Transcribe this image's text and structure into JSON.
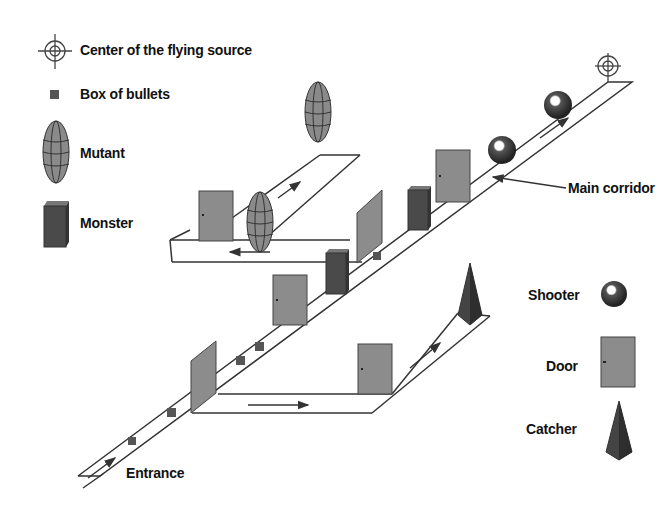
{
  "legend": {
    "items": [
      {
        "label": "Center of the flying source",
        "icon": "crosshair-icon"
      },
      {
        "label": "Box of bullets",
        "icon": "box-icon"
      },
      {
        "label": "Mutant",
        "icon": "ellipsoid-icon"
      },
      {
        "label": "Monster",
        "icon": "cuboid-icon"
      }
    ],
    "right_items": [
      {
        "label": "Shooter",
        "icon": "sphere-icon"
      },
      {
        "label": "Door",
        "icon": "door-icon"
      },
      {
        "label": "Catcher",
        "icon": "pyramid-icon"
      }
    ]
  },
  "annotations": {
    "main_corridor": "Main corridor",
    "entrance": "Entrance"
  },
  "colors": {
    "door": "#8c8c8c",
    "monster": "#4a4a4a",
    "shooter": "#3a3a3a",
    "line": "#333333",
    "mutant": "#8a8a8a"
  }
}
